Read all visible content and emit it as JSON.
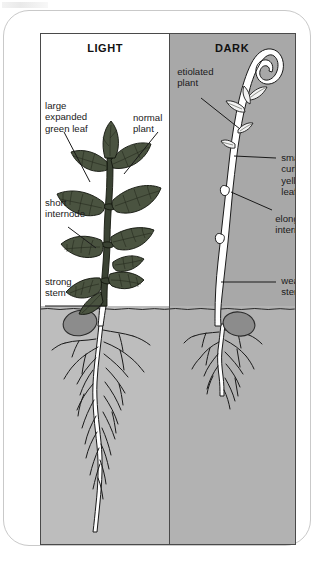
{
  "figure": {
    "type": "biology-diagram",
    "panels": [
      {
        "id": "light",
        "heading": "LIGHT",
        "background": "#ffffff",
        "soil_color": "#bdbdbd",
        "labels": [
          {
            "id": "large-expanded-green-leaf",
            "lines": [
              "large",
              "expanded",
              "green leaf"
            ]
          },
          {
            "id": "normal-plant",
            "lines": [
              "normal",
              "plant"
            ]
          },
          {
            "id": "short-internode",
            "lines": [
              "short",
              "internode"
            ]
          },
          {
            "id": "strong-stem",
            "lines": [
              "strong",
              "stem"
            ]
          }
        ]
      },
      {
        "id": "dark",
        "heading": "DARK",
        "background": "#a8a8a8",
        "soil_color": "#b2b2b2",
        "labels": [
          {
            "id": "etiolated-plant",
            "lines": [
              "etiolated",
              "plant"
            ]
          },
          {
            "id": "small-curled-yellow-leaf",
            "lines": [
              "small",
              "curled",
              "yellow",
              "leaf"
            ]
          },
          {
            "id": "elongated-internode",
            "lines": [
              "elongated",
              "internode"
            ]
          },
          {
            "id": "weak-stem",
            "lines": [
              "weak",
              "stem"
            ]
          }
        ]
      }
    ]
  },
  "light_panel": {
    "heading": "LIGHT",
    "label_large_leaf_1": "large",
    "label_large_leaf_2": "expanded",
    "label_large_leaf_3": "green leaf",
    "label_normal_plant_1": "normal",
    "label_normal_plant_2": "plant",
    "label_short_internode_1": "short",
    "label_short_internode_2": "internode",
    "label_strong_stem_1": "strong",
    "label_strong_stem_2": "stem"
  },
  "dark_panel": {
    "heading": "DARK",
    "label_etiolated_1": "etiolated",
    "label_etiolated_2": "plant",
    "label_small_leaf_1": "small",
    "label_small_leaf_2": "curled",
    "label_small_leaf_3": "yellow",
    "label_small_leaf_4": "leaf",
    "label_elongated_1": "elongated",
    "label_elongated_2": "internode",
    "label_weak_stem_1": "weak",
    "label_weak_stem_2": "stem"
  },
  "colors": {
    "dark_panel_bg": "#a8a8a8",
    "light_panel_bg": "#ffffff",
    "soil": "#bdbdbd",
    "seed": "#8c8c8c",
    "foliage": "#4a5340",
    "ink": "#1a1a1a",
    "frame": "#4a4a4a"
  }
}
